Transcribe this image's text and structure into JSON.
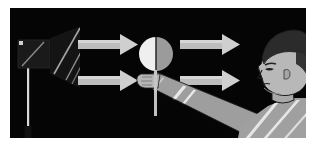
{
  "figure": {
    "domain_kind": "illustration",
    "panel": {
      "background_color": "#050505",
      "border_color": "#ffffff",
      "x": 10,
      "y": 8,
      "width": 296,
      "height": 130
    },
    "subject": "moon-phase demonstration: lamp light source, light ray arrows, half-lit ball on a stick held by a person"
  },
  "scene": {
    "lamp": {
      "name": "lamp-light-source",
      "body_color": "#1a1a1a",
      "cone_color": "#141414",
      "pole_color": "#d8d8d8",
      "highlight_color": "#9a9a9a",
      "housing": {
        "x": 12,
        "y": 36,
        "width": 30,
        "height": 26
      },
      "cone": {
        "x": 42,
        "y": 26,
        "width": 34,
        "height": 48
      },
      "pole": {
        "x": 28,
        "y": 62,
        "width": 2,
        "height": 68
      }
    },
    "arrows": {
      "name": "light-ray-arrows",
      "color": "#c9c9c9",
      "shaft_shade": "#b0b0b0",
      "count": 4,
      "items": [
        {
          "label": "incoming-ray-upper",
          "x": 78,
          "y": 34,
          "length": 54,
          "direction": "right"
        },
        {
          "label": "incoming-ray-lower",
          "x": 78,
          "y": 70,
          "length": 54,
          "direction": "right"
        },
        {
          "label": "outgoing-ray-upper",
          "x": 168,
          "y": 34,
          "length": 54,
          "direction": "right"
        },
        {
          "label": "outgoing-ray-lower",
          "x": 168,
          "y": 70,
          "length": 54,
          "direction": "right"
        }
      ]
    },
    "ball": {
      "name": "half-lit-ball",
      "lit_half_color": "#efefef",
      "dark_half_color": "#9b9b9b",
      "terminator_color": "#303030",
      "center_x": 146,
      "center_y": 46,
      "radius": 16,
      "stick": {
        "name": "ball-stick",
        "color": "#c0c0c0",
        "x": 145,
        "y": 62,
        "width": 3,
        "height": 46
      }
    },
    "person": {
      "name": "person-figure",
      "hair_color": "#2b2b2b",
      "skin_color": "#b4b4b4",
      "skin_shadow_color": "#8d8d8d",
      "shirt_color": "#9a9a9a",
      "shirt_highlight_color": "#e4e4e4",
      "outline_color": "#1c1c1c",
      "facing": "left",
      "hand": {
        "name": "hand-gripping-stick",
        "x": 134,
        "y": 72
      },
      "arm": {
        "name": "extended-arm",
        "from_x": 140,
        "from_y": 76,
        "to_x": 236,
        "to_y": 118
      },
      "head": {
        "name": "head-profile",
        "x": 252,
        "y": 22,
        "width": 56,
        "height": 70
      }
    }
  }
}
